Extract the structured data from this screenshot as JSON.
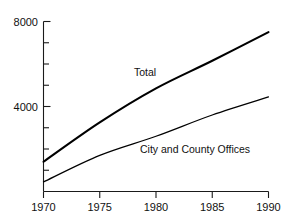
{
  "chart_data": {
    "type": "line",
    "title": "",
    "subtitle": "",
    "xlabel": "",
    "ylabel": "",
    "x": [
      1970,
      1975,
      1980,
      1985,
      1990
    ],
    "xlim": [
      1970,
      1990
    ],
    "ylim": [
      0,
      8000
    ],
    "grid": false,
    "legend_position": "inline-annotation",
    "x_tick_labels": [
      "1970",
      "1975",
      "1980",
      "1985",
      "1990"
    ],
    "y_tick_labels": [
      "4000",
      "8000"
    ],
    "y_major_ticks": [
      4000,
      8000
    ],
    "y_minor_ticks": [
      1000,
      2000,
      3000,
      5000,
      6000,
      7000
    ],
    "series": [
      {
        "name": "Total",
        "label": "Total",
        "color": "#000000",
        "values": [
          1400,
          3250,
          4850,
          6150,
          7500
        ]
      },
      {
        "name": "City and County Offices",
        "label": "City and County Offices",
        "color": "#000000",
        "values": [
          450,
          1700,
          2600,
          3600,
          4450
        ]
      }
    ],
    "annotations": [
      {
        "text": "Total",
        "x": 1977,
        "y": 5600
      },
      {
        "text": "City and County Offices",
        "x": 1978.5,
        "y": 2150
      }
    ]
  },
  "axes": {
    "x_ticks": [
      {
        "label": "1970"
      },
      {
        "label": "1975"
      },
      {
        "label": "1980"
      },
      {
        "label": "1985"
      },
      {
        "label": "1990"
      }
    ],
    "y_ticks": [
      {
        "label": "8000"
      },
      {
        "label": "4000"
      }
    ]
  },
  "labels": {
    "total": "Total",
    "city_county": "City and County Offices"
  },
  "colors": {
    "line": "#000000",
    "axis": "#1a1a1a",
    "text": "#111111",
    "background": "#ffffff"
  }
}
